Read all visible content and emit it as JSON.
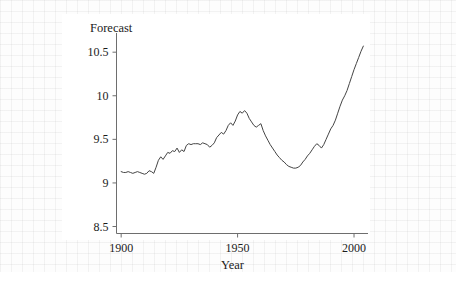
{
  "figure": {
    "axis_label_y": "Forecast",
    "axis_label_x": "Year",
    "line_color": "#444444",
    "axis_color": "#6e6e6e",
    "plot_background": "#ffffff",
    "page_background": "#fdfdfd"
  },
  "axes": {
    "y_ticks": [
      {
        "label": "8.5",
        "value": 8.5
      },
      {
        "label": "9",
        "value": 9.0
      },
      {
        "label": "9.5",
        "value": 9.5
      },
      {
        "label": "10",
        "value": 10.0
      },
      {
        "label": "10.5",
        "value": 10.5
      }
    ],
    "x_ticks": [
      {
        "label": "1900",
        "value": 1900
      },
      {
        "label": "1950",
        "value": 1950
      },
      {
        "label": "2000",
        "value": 2000
      }
    ]
  },
  "chart_data": {
    "type": "line",
    "title": "",
    "subtitle": "",
    "xlabel": "Year",
    "ylabel": "Forecast",
    "xlim": [
      1898,
      2006
    ],
    "ylim": [
      8.42,
      10.72
    ],
    "grid": false,
    "legend": null,
    "x_tick_labels": [
      "1900",
      "1950",
      "2000"
    ],
    "y_tick_labels": [
      "8.5",
      "9",
      "9.5",
      "10",
      "10.5"
    ],
    "series": [
      {
        "name": "Forecast",
        "color": "#444444",
        "x": [
          1900,
          1901,
          1902,
          1903,
          1904,
          1905,
          1906,
          1907,
          1908,
          1909,
          1910,
          1911,
          1912,
          1913,
          1914,
          1915,
          1916,
          1917,
          1918,
          1919,
          1920,
          1921,
          1922,
          1923,
          1924,
          1925,
          1926,
          1927,
          1928,
          1929,
          1930,
          1931,
          1932,
          1933,
          1934,
          1935,
          1936,
          1937,
          1938,
          1939,
          1940,
          1941,
          1942,
          1943,
          1944,
          1945,
          1946,
          1947,
          1948,
          1949,
          1950,
          1951,
          1952,
          1953,
          1954,
          1955,
          1956,
          1957,
          1958,
          1959,
          1960,
          1961,
          1962,
          1963,
          1964,
          1965,
          1966,
          1967,
          1968,
          1969,
          1970,
          1971,
          1972,
          1973,
          1974,
          1975,
          1976,
          1977,
          1978,
          1979,
          1980,
          1981,
          1982,
          1983,
          1984,
          1985,
          1986,
          1987,
          1988,
          1989,
          1990,
          1991,
          1992,
          1993,
          1994,
          1995,
          1996,
          1997,
          1998,
          1999,
          2000,
          2001,
          2002,
          2003,
          2004
        ],
        "y": [
          9.13,
          9.12,
          9.12,
          9.13,
          9.12,
          9.11,
          9.12,
          9.13,
          9.12,
          9.11,
          9.1,
          9.11,
          9.14,
          9.13,
          9.11,
          9.18,
          9.26,
          9.3,
          9.27,
          9.31,
          9.35,
          9.34,
          9.37,
          9.36,
          9.4,
          9.35,
          9.38,
          9.36,
          9.43,
          9.45,
          9.44,
          9.45,
          9.45,
          9.45,
          9.44,
          9.46,
          9.45,
          9.44,
          9.41,
          9.43,
          9.46,
          9.52,
          9.55,
          9.58,
          9.56,
          9.6,
          9.66,
          9.69,
          9.66,
          9.71,
          9.78,
          9.82,
          9.8,
          9.83,
          9.8,
          9.74,
          9.7,
          9.66,
          9.64,
          9.66,
          9.68,
          9.6,
          9.54,
          9.49,
          9.44,
          9.4,
          9.36,
          9.32,
          9.29,
          9.26,
          9.24,
          9.21,
          9.19,
          9.18,
          9.17,
          9.17,
          9.18,
          9.2,
          9.24,
          9.27,
          9.31,
          9.34,
          9.38,
          9.42,
          9.45,
          9.43,
          9.4,
          9.44,
          9.5,
          9.56,
          9.62,
          9.66,
          9.72,
          9.8,
          9.88,
          9.95,
          10.0,
          10.06,
          10.14,
          10.22,
          10.3,
          10.37,
          10.44,
          10.51,
          10.57
        ]
      }
    ]
  }
}
